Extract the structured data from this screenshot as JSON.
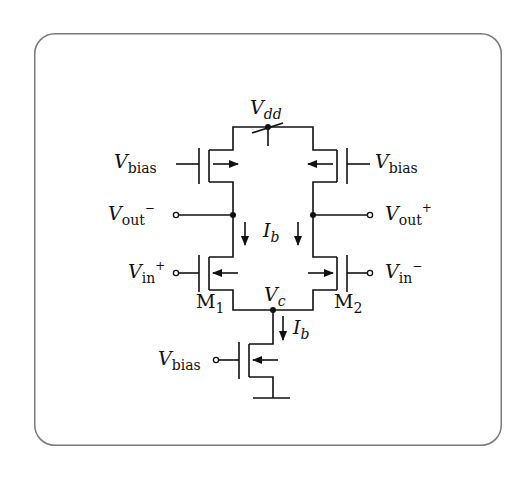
{
  "diagram": {
    "labels": {
      "vdd": {
        "main": "V",
        "sub": "dd"
      },
      "vbias_left": {
        "main": "V",
        "sub": "bias"
      },
      "vbias_right": {
        "main": "V",
        "sub": "bias"
      },
      "vbias_tail": {
        "main": "V",
        "sub": "bias"
      },
      "vout_minus": {
        "main": "V",
        "sub": "out",
        "sup": "−"
      },
      "vout_plus": {
        "main": "V",
        "sub": "out",
        "sup": "+"
      },
      "vin_plus": {
        "main": "V",
        "sub": "in",
        "sup": "+"
      },
      "vin_minus": {
        "main": "V",
        "sub": "in",
        "sup": "−"
      },
      "ib_center": {
        "main": "I",
        "sub": "b"
      },
      "ib_tail": {
        "main": "I",
        "sub": "b"
      },
      "vc": {
        "main": "V",
        "sub": "c"
      },
      "m1": {
        "main": "M",
        "sub": "1"
      },
      "m2": {
        "main": "M",
        "sub": "2"
      }
    },
    "colors": {
      "line": "#111111",
      "frame": "#7a7a7a",
      "background": "#ffffff"
    }
  }
}
